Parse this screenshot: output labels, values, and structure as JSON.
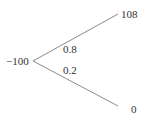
{
  "tree": {
    "root": {
      "value": "−100"
    },
    "branches": [
      {
        "probability": "0.8",
        "outcome": "108"
      },
      {
        "probability": "0.2",
        "outcome": "0"
      }
    ]
  },
  "colors": {
    "line": "#8a8a8a",
    "text": "#333333"
  }
}
